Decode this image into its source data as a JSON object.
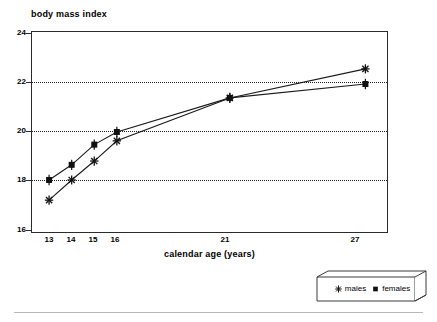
{
  "chart_data": {
    "type": "line",
    "title": "",
    "ylabel": "body mass index",
    "xlabel": "calendar age (years)",
    "x": [
      13,
      14,
      15,
      16,
      21,
      27
    ],
    "categories": [
      "13",
      "14",
      "15",
      "16",
      "21",
      "27"
    ],
    "series": [
      {
        "name": "males",
        "marker": "asterisk",
        "values": [
          17.3,
          18.1,
          18.85,
          19.65,
          21.35,
          22.5
        ]
      },
      {
        "name": "females",
        "marker": "square",
        "values": [
          18.1,
          18.7,
          19.5,
          20.0,
          21.35,
          21.9
        ]
      }
    ],
    "xlim": [
      12.2,
      28.0
    ],
    "ylim": [
      16,
      24
    ],
    "yticks": [
      "16",
      "18",
      "20",
      "22",
      "24"
    ],
    "ytick_values": [
      16,
      18,
      20,
      22,
      24
    ],
    "xticks": [
      "13",
      "14",
      "15",
      "16",
      "21",
      "27"
    ],
    "xtick_values": [
      13,
      14,
      15,
      16,
      21,
      27
    ],
    "gridlines": [
      18,
      20,
      22
    ],
    "grid": "horizontal-dotted",
    "legend_position": "outside-bottom-right"
  },
  "axes": {
    "y_axis_title": "body mass index",
    "x_axis_title": "calendar age (years)",
    "y_labels": [
      "24",
      "22",
      "20",
      "18",
      "16"
    ],
    "x_labels": [
      "13",
      "14",
      "15",
      "16",
      "21",
      "27"
    ]
  },
  "legend": {
    "items": [
      {
        "label": "males",
        "marker": "asterisk-marker-icon"
      },
      {
        "label": "females",
        "marker": "square-marker-icon"
      }
    ]
  },
  "colors": {
    "line": "#1a1a1a",
    "axis": "#2b2b2b",
    "grid": "#1f1f1f",
    "background": "#ffffff",
    "rule": "#b8b8b8"
  }
}
